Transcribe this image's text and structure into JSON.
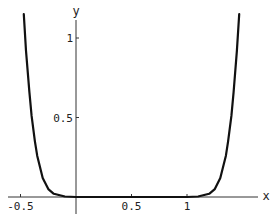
{
  "chart_data": {
    "type": "line",
    "title": "",
    "xlabel": "x",
    "ylabel": "y",
    "xlim": [
      -0.55,
      1.6
    ],
    "ylim": [
      -0.05,
      1.15
    ],
    "grid": false,
    "legend": null,
    "x_ticks": [
      {
        "value": -0.5,
        "label": "-0.5"
      },
      {
        "value": 0.5,
        "label": "0.5"
      },
      {
        "value": 1,
        "label": "1"
      }
    ],
    "y_ticks": [
      {
        "value": 0.5,
        "label": "0.5"
      },
      {
        "value": 1,
        "label": "1"
      }
    ],
    "series": [
      {
        "name": "curve",
        "color": "#111111",
        "x": [
          -0.47,
          -0.45,
          -0.42,
          -0.4,
          -0.37,
          -0.35,
          -0.3,
          -0.25,
          -0.2,
          -0.1,
          0,
          0.25,
          0.5,
          0.75,
          1.0,
          1.1,
          1.2,
          1.25,
          1.3,
          1.35,
          1.37,
          1.4,
          1.42,
          1.45,
          1.47
        ],
        "y": [
          1.15,
          0.92,
          0.66,
          0.51,
          0.35,
          0.26,
          0.12,
          0.05,
          0.02,
          0.003,
          0.0,
          0.0,
          0.0,
          0.0,
          0.0,
          0.003,
          0.02,
          0.05,
          0.12,
          0.26,
          0.35,
          0.51,
          0.66,
          0.92,
          1.15
        ]
      }
    ]
  }
}
